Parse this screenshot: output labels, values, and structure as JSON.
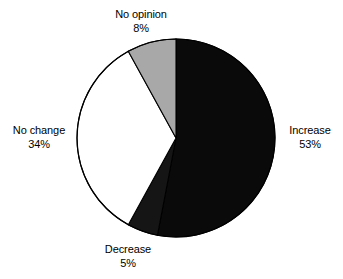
{
  "chart_data": {
    "type": "pie",
    "title": "",
    "subtitle": "",
    "xlabel": "",
    "ylabel": "",
    "legend_position": "none",
    "grid": false,
    "units": "percent",
    "start_angle_deg": 0,
    "direction": "clockwise",
    "categories": [
      "Increase",
      "Decrease",
      "No change",
      "No opinion"
    ],
    "values": [
      53,
      5,
      34,
      8
    ],
    "slices": [
      {
        "label": "Increase",
        "value": 53,
        "value_text": "53%",
        "color": "#0a0a0a",
        "stroke": "#000000",
        "start_deg": 0,
        "end_deg": 190.8,
        "label_position": "right"
      },
      {
        "label": "Decrease",
        "value": 5,
        "value_text": "5%",
        "color": "#151515",
        "stroke": "#000000",
        "start_deg": 190.8,
        "end_deg": 208.8,
        "label_position": "bottom"
      },
      {
        "label": "No change",
        "value": 34,
        "value_text": "34%",
        "color": "#ffffff",
        "stroke": "#000000",
        "start_deg": 208.8,
        "end_deg": 331.2,
        "label_position": "left"
      },
      {
        "label": "No opinion",
        "value": 8,
        "value_text": "8%",
        "color": "#a8a8a8",
        "stroke": "#000000",
        "start_deg": 331.2,
        "end_deg": 360,
        "label_position": "top"
      }
    ],
    "geometry": {
      "center_x": 176,
      "center_y": 138,
      "radius": 99
    },
    "colors": {
      "background": "#ffffff",
      "text": "#000000",
      "outline": "#000000",
      "black_slice": "#0a0a0a",
      "gray_slice": "#a8a8a8",
      "white_slice": "#ffffff"
    }
  },
  "labels": {
    "no_opinion": {
      "name": "No opinion",
      "percent": "8%"
    },
    "increase": {
      "name": "Increase",
      "percent": "53%"
    },
    "no_change": {
      "name": "No change",
      "percent": "34%"
    },
    "decrease": {
      "name": "Decrease",
      "percent": "5%"
    }
  }
}
